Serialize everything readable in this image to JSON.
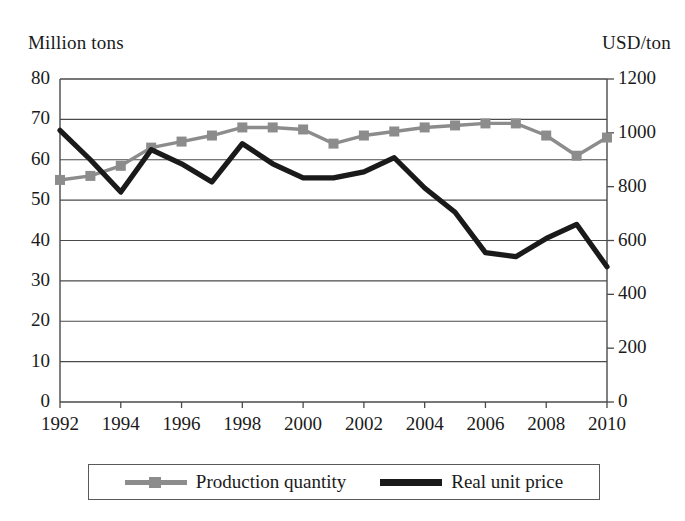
{
  "chart_data": {
    "type": "line",
    "title": "",
    "xlabel": "",
    "ylabel": "Million tons",
    "y2label": "USD/ton",
    "grid": true,
    "legend_position": "bottom",
    "x": [
      1992,
      1993,
      1994,
      1995,
      1996,
      1997,
      1998,
      1999,
      2000,
      2001,
      2002,
      2003,
      2004,
      2005,
      2006,
      2007,
      2008,
      2009,
      2010
    ],
    "xtick_labels": [
      "1992",
      "1994",
      "1996",
      "1998",
      "2000",
      "2002",
      "2004",
      "2006",
      "2008",
      "2010"
    ],
    "xticks": [
      1992,
      1994,
      1996,
      1998,
      2000,
      2002,
      2004,
      2006,
      2008,
      2010
    ],
    "xlim": [
      1992,
      2010
    ],
    "ylim": [
      0,
      80
    ],
    "yticks": [
      0,
      10,
      20,
      30,
      40,
      50,
      60,
      70,
      80
    ],
    "ytick_labels": [
      "0",
      "10",
      "20",
      "30",
      "40",
      "50",
      "60",
      "70",
      "80"
    ],
    "y2lim": [
      0,
      1200
    ],
    "y2ticks": [
      0,
      200,
      400,
      600,
      800,
      1000,
      1200
    ],
    "y2tick_labels": [
      "0",
      "200",
      "400",
      "600",
      "800",
      "1000",
      "1200"
    ],
    "series": [
      {
        "name": "Production quantity",
        "axis": "left",
        "unit": "Million tons",
        "color": "#8c8c8c",
        "marker": "square",
        "values": [
          55.0,
          56.0,
          58.5,
          63.0,
          64.5,
          66.0,
          68.0,
          68.0,
          67.5,
          64.0,
          66.0,
          67.0,
          68.0,
          68.5,
          69.0,
          69.0,
          66.0,
          61.0,
          65.5
        ]
      },
      {
        "name": "Real unit price",
        "axis": "right",
        "unit": "USD/ton",
        "color": "#1a1a1a",
        "marker": "none",
        "values_left_scale": [
          67.3,
          60.0,
          52.0,
          62.5,
          59.0,
          54.5,
          64.0,
          59.0,
          55.5,
          55.5,
          57.0,
          60.5,
          53.0,
          47.0,
          37.0,
          36.0,
          40.5,
          44.0,
          33.5
        ],
        "values": [
          1010,
          900,
          780,
          938,
          885,
          818,
          960,
          885,
          833,
          833,
          855,
          908,
          795,
          705,
          555,
          540,
          608,
          660,
          503
        ]
      }
    ]
  },
  "labels": {
    "left_axis_title": "Million tons",
    "right_axis_title": "USD/ton"
  },
  "legend": {
    "items": [
      {
        "label": "Production quantity",
        "color": "#8c8c8c",
        "marker": "square"
      },
      {
        "label": "Real unit price",
        "color": "#1a1a1a",
        "marker": "none"
      }
    ]
  }
}
